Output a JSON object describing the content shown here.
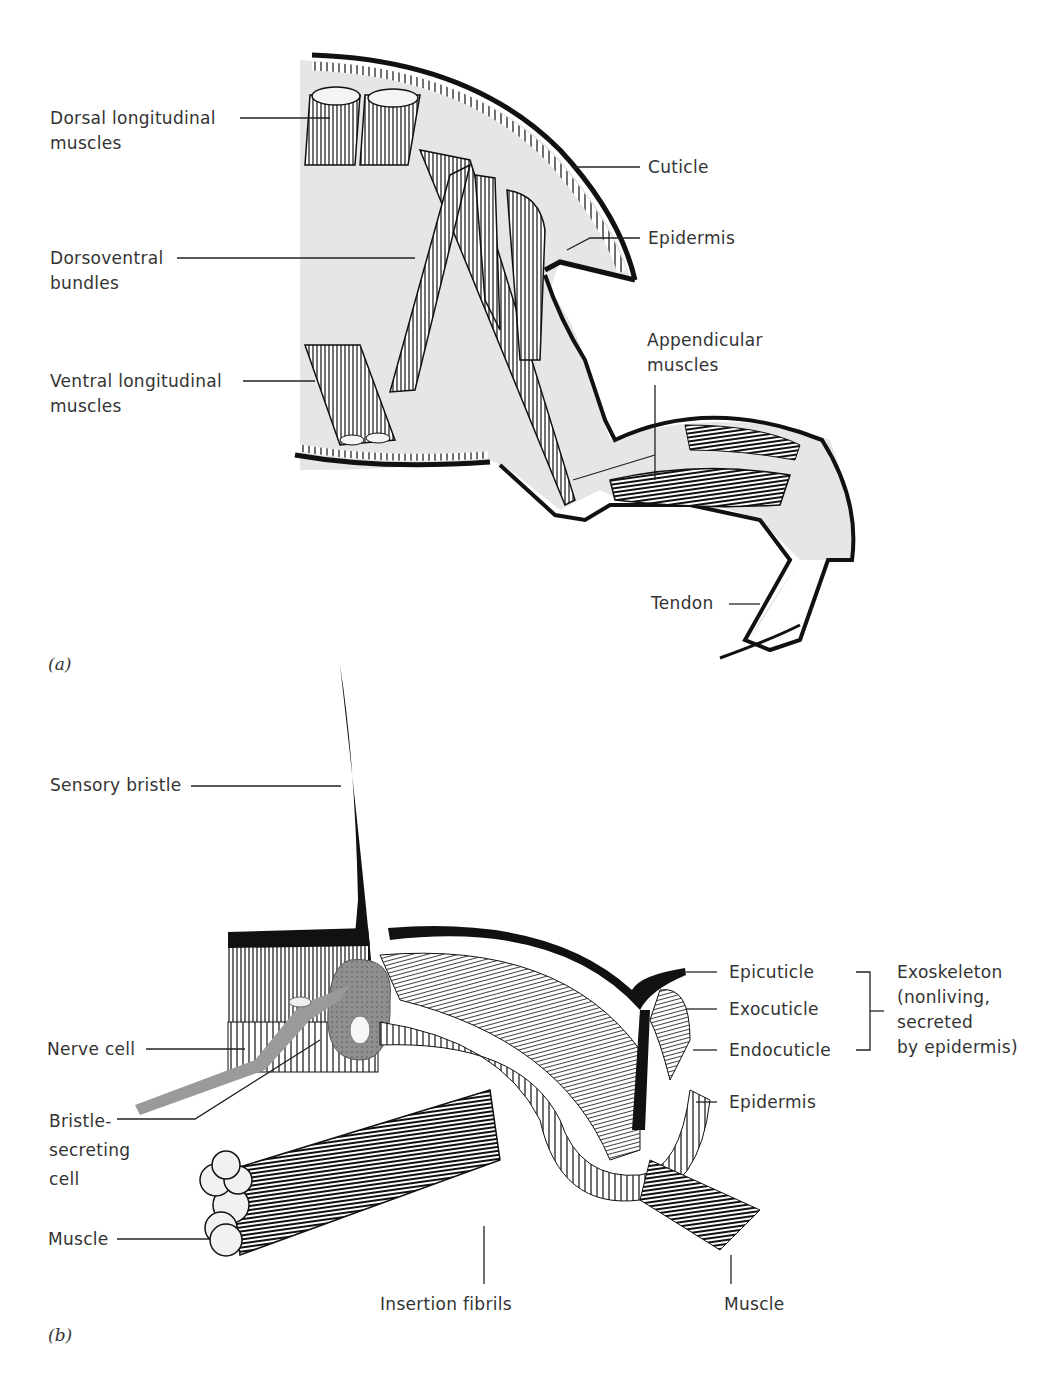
{
  "figure": {
    "panels": [
      {
        "id": "a",
        "label": "(a)",
        "subject": "Arthropod body wall and leg, musculature",
        "labels": {
          "dorsal_longitudinal_1": "Dorsal longitudinal",
          "dorsal_longitudinal_2": "muscles",
          "dorsoventral_1": "Dorsoventral",
          "dorsoventral_2": "bundles",
          "ventral_longitudinal_1": "Ventral longitudinal",
          "ventral_longitudinal_2": "muscles",
          "cuticle": "Cuticle",
          "epidermis": "Epidermis",
          "appendicular_1": "Appendicular",
          "appendicular_2": "muscles",
          "tendon": "Tendon"
        }
      },
      {
        "id": "b",
        "label": "(b)",
        "subject": "Cross-section of arthropod exoskeleton with sensory bristle",
        "labels": {
          "sensory_bristle": "Sensory bristle",
          "nerve_cell": "Nerve cell",
          "bristle_secreting_1": "Bristle-",
          "bristle_secreting_2": "secreting",
          "bristle_secreting_3": "cell",
          "muscle_left": "Muscle",
          "epicuticle": "Epicuticle",
          "exocuticle": "Exocuticle",
          "endocuticle": "Endocuticle",
          "epidermis": "Epidermis",
          "insertion_fibrils": "Insertion fibrils",
          "muscle_right": "Muscle",
          "exoskeleton_1": "Exoskeleton",
          "exoskeleton_2": "(nonliving,",
          "exoskeleton_3": "secreted",
          "exoskeleton_4": "by epidermis)"
        }
      }
    ],
    "colors": {
      "ink": "#111111",
      "body_fill": "#e4e4e4",
      "cell_gray": "#9a9a9a",
      "text": "#333333"
    }
  }
}
